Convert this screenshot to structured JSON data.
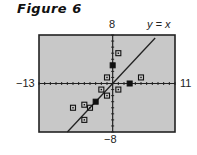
{
  "figure": {
    "title": "Figure 6"
  },
  "chart_data": {
    "type": "scatter",
    "title": "Figure 6",
    "xlabel": "",
    "ylabel": "",
    "xlim": [
      -13,
      11
    ],
    "ylim": [
      -8,
      8
    ],
    "tick_labels": {
      "xmin": "−13",
      "xmax": "11",
      "ymax": "8",
      "ymin": "−8"
    },
    "grid": false,
    "background": "#c8c8c8",
    "series": [
      {
        "name": "data points",
        "marker": "square",
        "points": [
          {
            "x": 1,
            "y": 5
          },
          {
            "x": 0,
            "y": 3,
            "filled": true
          },
          {
            "x": -1,
            "y": 1
          },
          {
            "x": 5,
            "y": 1
          },
          {
            "x": 3,
            "y": 0,
            "filled": true
          },
          {
            "x": -2,
            "y": -1
          },
          {
            "x": 1,
            "y": -1
          },
          {
            "x": -1,
            "y": -2
          },
          {
            "x": -3,
            "y": -3,
            "filled": true
          },
          {
            "x": -5,
            "y": -3.5
          },
          {
            "x": -4,
            "y": -4
          },
          {
            "x": -7,
            "y": -4
          },
          {
            "x": -5,
            "y": -6
          }
        ]
      },
      {
        "name": "y = x",
        "type": "line",
        "label": "y = x",
        "from": {
          "x": -8,
          "y": -8
        },
        "to": {
          "x": 7.5,
          "y": 7.5
        }
      }
    ]
  }
}
